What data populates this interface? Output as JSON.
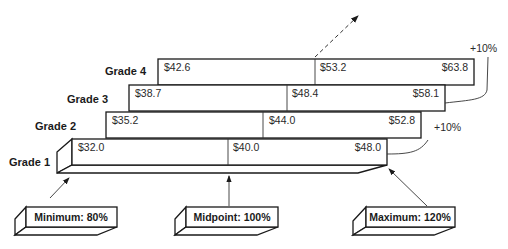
{
  "diagram": {
    "grades": [
      {
        "label": "Grade 1",
        "minimum": "$32.0",
        "midpoint": "$40.0",
        "maximum": "$48.0"
      },
      {
        "label": "Grade 2",
        "minimum": "$35.2",
        "midpoint": "$44.0",
        "maximum": "$52.8"
      },
      {
        "label": "Grade 3",
        "minimum": "$38.7",
        "midpoint": "$48.4",
        "maximum": "$58.1"
      },
      {
        "label": "Grade 4",
        "minimum": "$42.6",
        "midpoint": "$53.2",
        "maximum": "$63.8"
      }
    ],
    "increments": [
      {
        "label": "+10%",
        "between": "Grade 1 to Grade 2"
      },
      {
        "label": "+10%",
        "between": "Grade 3 to Grade 4"
      }
    ],
    "callouts": {
      "minimum": "Minimum: 80%",
      "midpoint": "Midpoint: 100%",
      "maximum": "Maximum: 120%"
    },
    "colors": {
      "line": "#1a1a1a",
      "background": "#ffffff"
    }
  }
}
